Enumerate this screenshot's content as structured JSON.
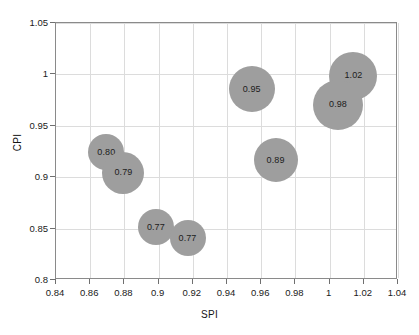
{
  "chart_data": {
    "type": "scatter",
    "title": "",
    "xlabel": "SPI",
    "ylabel": "CPI",
    "xlim": [
      0.84,
      1.04
    ],
    "ylim": [
      0.8,
      1.05
    ],
    "grid": true,
    "legend": null,
    "bubble_color": "#9e9e9e",
    "xticks": [
      "0.84",
      "0.86",
      "0.88",
      "0.9",
      "0.92",
      "0.94",
      "0.96",
      "0.98",
      "1",
      "1.02",
      "1.04"
    ],
    "xtick_values": [
      0.84,
      0.86,
      0.88,
      0.9,
      0.92,
      0.94,
      0.96,
      0.98,
      1.0,
      1.02,
      1.04
    ],
    "yticks": [
      "0.8",
      "0.85",
      "0.9",
      "0.95",
      "1",
      "1.05"
    ],
    "ytick_values": [
      0.8,
      0.85,
      0.9,
      0.95,
      1.0,
      1.05
    ],
    "points": [
      {
        "label": "0.80",
        "x": 0.87,
        "y": 0.9235,
        "size": 36
      },
      {
        "label": "0.79",
        "x": 0.88,
        "y": 0.9035,
        "size": 42
      },
      {
        "label": "0.77",
        "x": 0.899,
        "y": 0.8505,
        "size": 36
      },
      {
        "label": "0.77",
        "x": 0.9175,
        "y": 0.8395,
        "size": 36
      },
      {
        "label": "0.95",
        "x": 0.955,
        "y": 0.9845,
        "size": 46
      },
      {
        "label": "0.89",
        "x": 0.969,
        "y": 0.9155,
        "size": 44
      },
      {
        "label": "1.02",
        "x": 1.0145,
        "y": 0.9975,
        "size": 48
      },
      {
        "label": "0.98",
        "x": 1.0055,
        "y": 0.9695,
        "size": 50
      }
    ]
  }
}
